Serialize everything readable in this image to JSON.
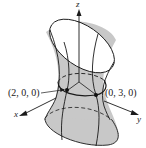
{
  "figure": {
    "type": "hyperboloid-of-one-sheet",
    "axes": {
      "x": "x",
      "y": "y",
      "z": "z"
    },
    "points": [
      {
        "label": "(2, 0, 0)"
      },
      {
        "label": "(0, 3, 0)"
      }
    ],
    "colors": {
      "surface": "#c8c8c8",
      "line": "#1a1a1a",
      "background": "#ffffff"
    }
  }
}
